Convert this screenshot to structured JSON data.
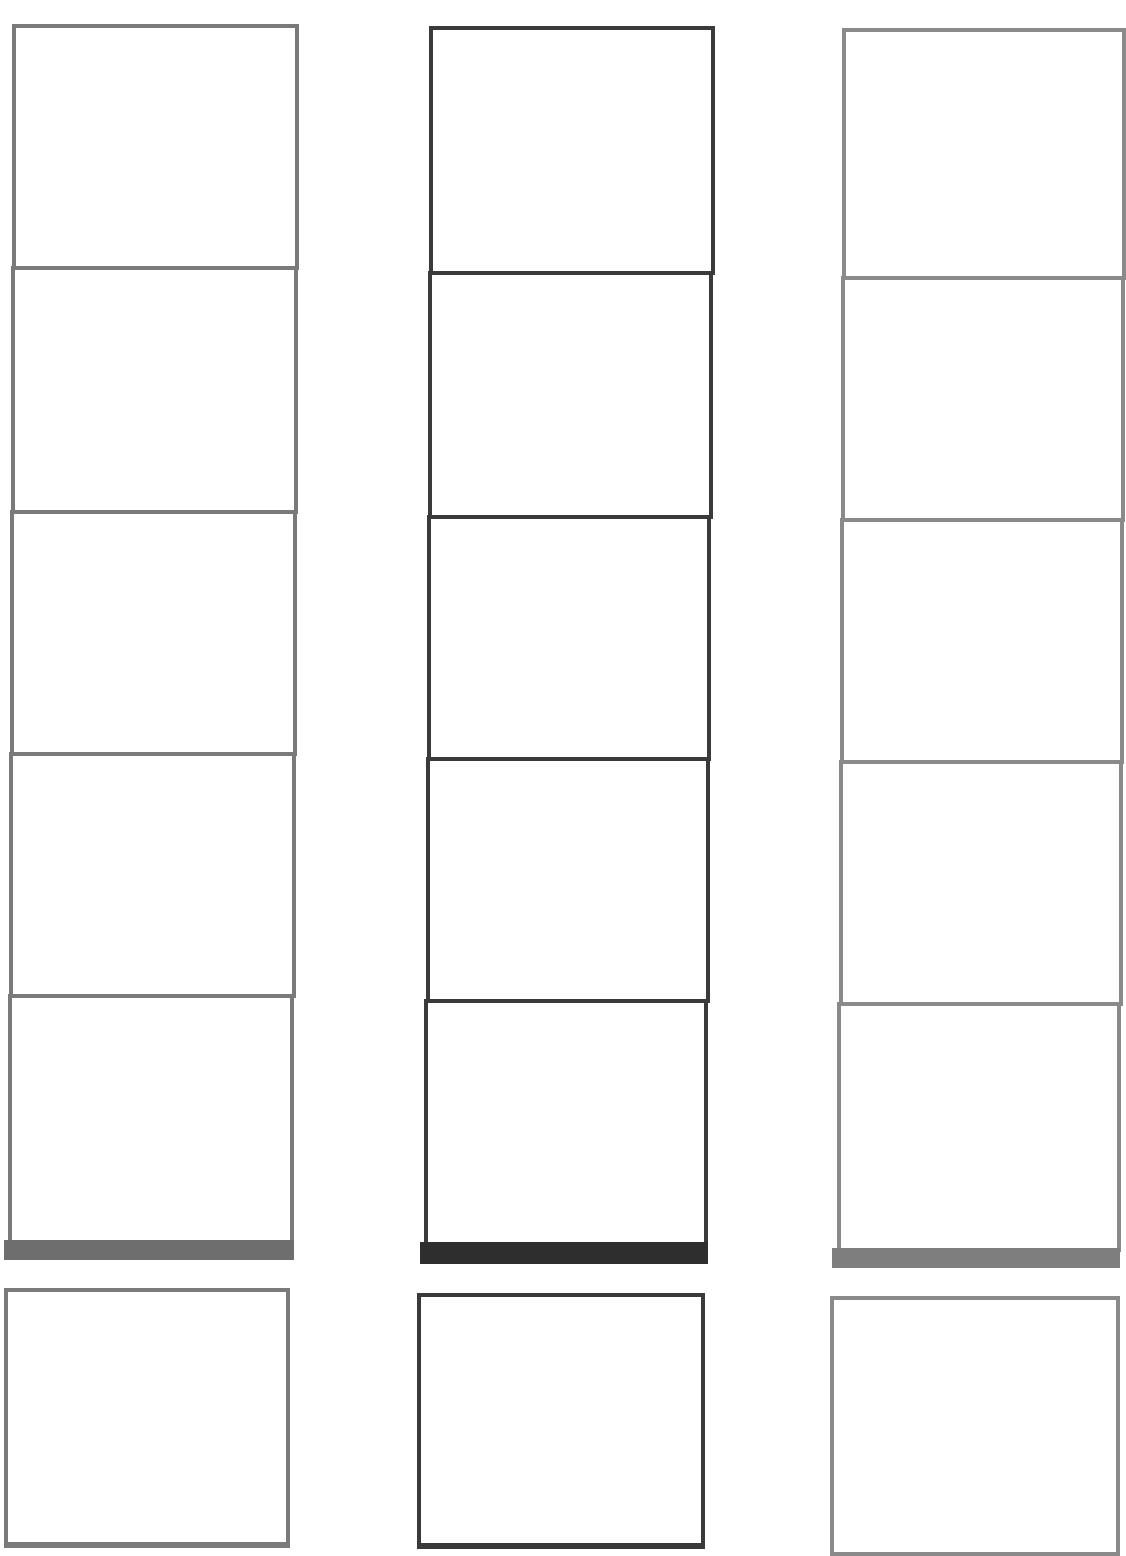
{
  "page": {
    "title": "",
    "title_visible": false
  },
  "strips": [
    {
      "name": "left",
      "border_color": "#7a7a7a",
      "bar_color": "#6e6e6e",
      "cells": 5
    },
    {
      "name": "middle",
      "border_color": "#3a3a3a",
      "bar_color": "#2e2e2e",
      "cells": 5
    },
    {
      "name": "right",
      "border_color": "#8a8a8a",
      "bar_color": "#7e7e7e",
      "cells": 5
    }
  ],
  "extra_boxes": [
    {
      "name": "left-extra",
      "border_color": "#7a7a7a"
    },
    {
      "name": "middle-extra",
      "border_color": "#3a3a3a"
    },
    {
      "name": "right-extra",
      "border_color": "#8a8a8a"
    }
  ]
}
